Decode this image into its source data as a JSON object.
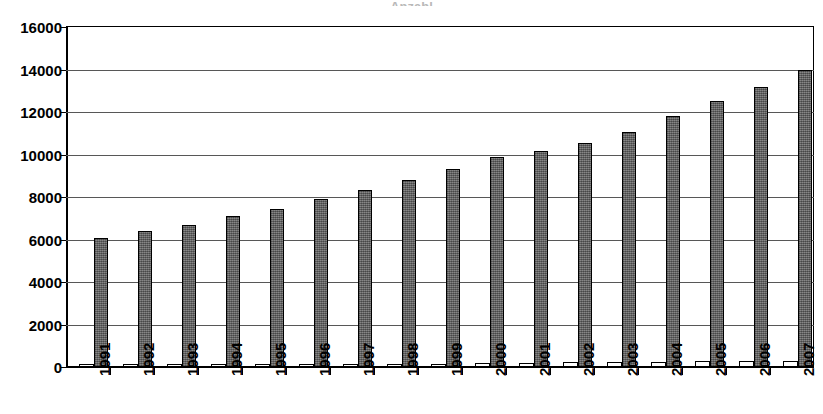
{
  "chart_data": {
    "type": "bar",
    "title": "",
    "xlabel": "",
    "ylabel": "",
    "ylim": [
      0,
      16000
    ],
    "ytick_interval": 2000,
    "ytick_labels": [
      "0",
      "2000",
      "4000",
      "6000",
      "8000",
      "10000",
      "12000",
      "14000",
      "16000"
    ],
    "ytick_values": [
      0,
      2000,
      4000,
      6000,
      8000,
      10000,
      12000,
      14000,
      16000
    ],
    "grid": true,
    "legend": "none",
    "orientation": "vertical",
    "bar_group_style": "clustered",
    "categories": [
      "1991",
      "1992",
      "1993",
      "1994",
      "1995",
      "1996",
      "1997",
      "1998",
      "1999",
      "2000",
      "2001",
      "2002",
      "2003",
      "2004",
      "2005",
      "2006",
      "2007"
    ],
    "series": [
      {
        "name": "series-2",
        "fill": "#ffffff",
        "values": [
          40,
          50,
          60,
          70,
          90,
          110,
          120,
          130,
          160,
          180,
          190,
          220,
          240,
          250,
          270,
          290,
          300
        ]
      },
      {
        "name": "series-1",
        "fill": "#6e6e6e",
        "values": [
          6050,
          6400,
          6700,
          7100,
          7450,
          7900,
          8350,
          8800,
          9300,
          9900,
          10150,
          10550,
          11050,
          11800,
          12500,
          13200,
          14000
        ]
      }
    ]
  },
  "axis": {
    "y_tick_labels": [
      "16000",
      "14000",
      "12000",
      "10000",
      "8000",
      "6000",
      "4000",
      "2000",
      "0"
    ],
    "x_tick_labels": [
      "1991",
      "1992",
      "1993",
      "1994",
      "1995",
      "1996",
      "1997",
      "1998",
      "1999",
      "2000",
      "2001",
      "2002",
      "2003",
      "2004",
      "2005",
      "2006",
      "2007"
    ]
  },
  "colors": {
    "main_bar": "#6e6e6e",
    "secondary_bar": "#ffffff",
    "bar_outline": "#000000",
    "gridline": "#575757",
    "axis": "#000000",
    "text": "#000000",
    "background": "#ffffff"
  },
  "title_remnant": "Anzahl"
}
